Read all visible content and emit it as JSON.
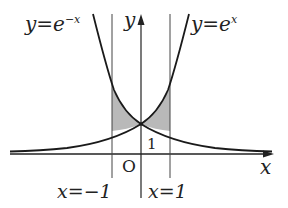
{
  "diagram": {
    "title": "",
    "curves": [
      {
        "id": "exp-neg",
        "label_prefix": "y=e",
        "label_exp": "−x",
        "equation": "y = e^(-x)"
      },
      {
        "id": "exp-pos",
        "label_prefix": "y=e",
        "label_exp": "x",
        "equation": "y = e^x"
      }
    ],
    "axes": {
      "x_label": "x",
      "y_label": "y",
      "origin_label": "O"
    },
    "vertical_lines": [
      {
        "id": "x-neg-one",
        "label": "x=−1",
        "x": -1
      },
      {
        "id": "x-pos-one",
        "label": "x=1",
        "x": 1
      }
    ],
    "intersection": {
      "x": 0,
      "y": 1,
      "label": "1"
    },
    "shaded_regions": [
      {
        "between": [
          "y=e^-x",
          "y=e^x"
        ],
        "from_x": -1,
        "to_x": 0
      },
      {
        "between": [
          "y=e^x",
          "y=e^-x"
        ],
        "from_x": 0,
        "to_x": 1
      }
    ],
    "colors": {
      "ink": "#222222",
      "shade": "#b9b9b9",
      "background": "#ffffff"
    }
  }
}
